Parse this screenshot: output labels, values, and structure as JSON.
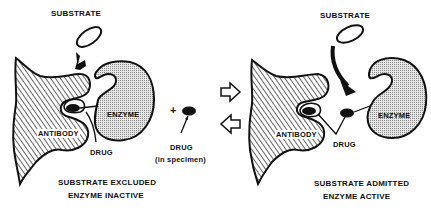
{
  "diagram": {
    "colors": {
      "ink": "#111111",
      "background": "#ffffff",
      "antibody_hatch": "#222222",
      "enzyme_stipple": "#bdbdbd"
    },
    "left_panel": {
      "substrate_label": "SUBSTRATE",
      "antibody_label": "ANTIBODY",
      "enzyme_label": "ENZYME",
      "drug_label": "DRUG",
      "caption_line1": "SUBSTRATE EXCLUDED",
      "caption_line2": "ENZYME INACTIVE"
    },
    "middle": {
      "plus_sign": "+",
      "drug_label": "DRUG",
      "drug_sublabel": "(in specimen)",
      "arrow_forward": "open-arrow-right",
      "arrow_backward": "open-arrow-left"
    },
    "right_panel": {
      "substrate_label": "SUBSTRATE",
      "antibody_label": "ANTIBODY",
      "enzyme_label": "ENZYME",
      "drug_label": "DRUG",
      "caption_line1": "SUBSTRATE ADMITTED",
      "caption_line2": "ENZYME ACTIVE"
    }
  }
}
